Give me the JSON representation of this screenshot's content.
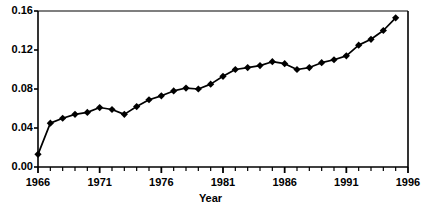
{
  "chart_data": {
    "type": "line",
    "title": "",
    "subtitle": "",
    "xlabel": "Year",
    "ylabel": "",
    "xlim": [
      1966,
      1996
    ],
    "ylim": [
      0.0,
      0.16
    ],
    "grid": false,
    "legend": null,
    "x_tick_labels": [
      "1966",
      "1971",
      "1976",
      "1981",
      "1986",
      "1991",
      "1996"
    ],
    "x_tick_values": [
      1966,
      1971,
      1976,
      1981,
      1986,
      1991,
      1996
    ],
    "x_minor_tick_step": 1,
    "y_tick_labels": [
      "0.00",
      "0.04",
      "0.08",
      "0.12",
      "0.16"
    ],
    "y_tick_values": [
      0.0,
      0.04,
      0.08,
      0.12,
      0.16
    ],
    "marker": "diamond",
    "marker_color": "#000000",
    "line_color": "#000000",
    "x": [
      1966,
      1967,
      1968,
      1969,
      1970,
      1971,
      1972,
      1973,
      1974,
      1975,
      1976,
      1977,
      1978,
      1979,
      1980,
      1981,
      1982,
      1983,
      1984,
      1985,
      1986,
      1987,
      1988,
      1989,
      1990,
      1991,
      1992,
      1993,
      1994,
      1995
    ],
    "values": [
      0.013,
      0.045,
      0.05,
      0.054,
      0.056,
      0.061,
      0.059,
      0.054,
      0.062,
      0.069,
      0.073,
      0.078,
      0.081,
      0.08,
      0.085,
      0.093,
      0.1,
      0.102,
      0.104,
      0.108,
      0.106,
      0.1,
      0.102,
      0.107,
      0.11,
      0.114,
      0.125,
      0.131,
      0.14,
      0.153
    ],
    "series": [
      {
        "name": "",
        "values": [
          0.013,
          0.045,
          0.05,
          0.054,
          0.056,
          0.061,
          0.059,
          0.054,
          0.062,
          0.069,
          0.073,
          0.078,
          0.081,
          0.08,
          0.085,
          0.093,
          0.1,
          0.102,
          0.104,
          0.108,
          0.106,
          0.1,
          0.102,
          0.107,
          0.11,
          0.114,
          0.125,
          0.131,
          0.14,
          0.153
        ]
      }
    ]
  },
  "axis": {
    "x_title": "Year"
  }
}
